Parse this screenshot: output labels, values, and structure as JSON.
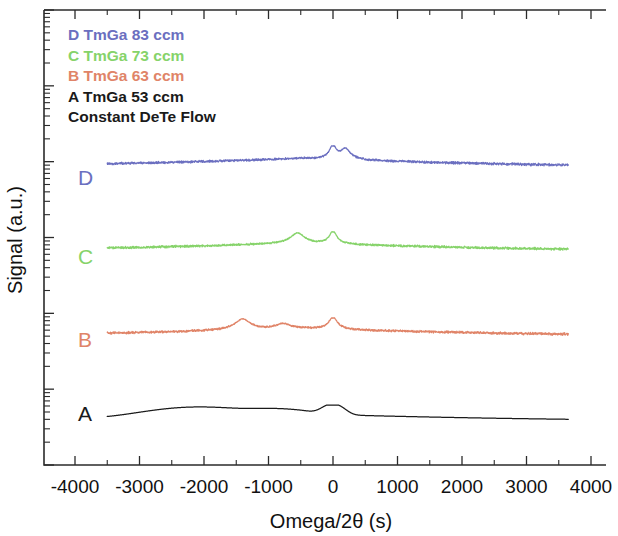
{
  "figure": {
    "axis_titles": {
      "x": "Omega/2θ (s)",
      "y": "Signal (a.u.)"
    }
  },
  "legend": {
    "entries": [
      {
        "label": "D TmGa 83 ccm",
        "color": "#6b6fc0"
      },
      {
        "label": "C TmGa 73 ccm",
        "color": "#86d36a"
      },
      {
        "label": "B TmGa 63 ccm",
        "color": "#e08468"
      },
      {
        "label": "A TmGa 53 ccm",
        "color": "#1a1a1a"
      },
      {
        "label": "Constant DeTe Flow",
        "color": "#1a1a1a"
      }
    ]
  },
  "curve_labels": [
    {
      "text": "D",
      "color": "#6b6fc0"
    },
    {
      "text": "C",
      "color": "#86d36a"
    },
    {
      "text": "B",
      "color": "#e08468"
    },
    {
      "text": "A",
      "color": "#1a1a1a"
    }
  ],
  "chart_data": {
    "type": "line",
    "title": "",
    "xlabel": "Omega/2θ (s)",
    "ylabel": "Signal (a.u.)",
    "xlim": [
      -4300,
      4300
    ],
    "xticks": [
      -4000,
      -3000,
      -2000,
      -1000,
      0,
      1000,
      2000,
      3000,
      4000
    ],
    "xtick_labels": [
      "-4000",
      "-3000",
      "-2000",
      "-1000",
      "0",
      "1000",
      "2000",
      "3000",
      "4000"
    ],
    "x_minor_tick_interval": 500,
    "y_axis": {
      "scale": "log",
      "labels_shown": false,
      "tick_style": "log-decade-minor-ticks",
      "decades": 6
    },
    "grid": false,
    "legend_position": "top-left",
    "x_data_range": [
      -3500,
      3650
    ],
    "series": [
      {
        "name": "A TmGa 53 ccm",
        "label": "A",
        "color": "#1a1a1a",
        "offset_index": 0,
        "noisy": false,
        "baseline": 0.1,
        "peaks": [
          {
            "center": 0,
            "height": 1.0,
            "width": 130,
            "kind": "main"
          },
          {
            "center": -850,
            "height": 0.3,
            "width": 380,
            "kind": "satellite"
          },
          {
            "center": -2100,
            "height": 0.62,
            "width": 620,
            "kind": "satellite"
          }
        ]
      },
      {
        "name": "B TmGa 63 ccm",
        "label": "B",
        "color": "#e08468",
        "offset_index": 1,
        "noisy": true,
        "baseline": 0.08,
        "peaks": [
          {
            "center": 0,
            "height": 1.0,
            "width": 55,
            "kind": "main"
          },
          {
            "center": -780,
            "height": 0.26,
            "width": 120,
            "kind": "satellite"
          },
          {
            "center": -1400,
            "height": 0.74,
            "width": 105,
            "kind": "satellite"
          }
        ]
      },
      {
        "name": "C TmGa 73 ccm",
        "label": "C",
        "color": "#86d36a",
        "offset_index": 2,
        "noisy": true,
        "baseline": 0.08,
        "peaks": [
          {
            "center": 0,
            "height": 1.0,
            "width": 48,
            "kind": "main"
          },
          {
            "center": -550,
            "height": 0.7,
            "width": 95,
            "kind": "satellite"
          }
        ]
      },
      {
        "name": "D TmGa 83 ccm",
        "label": "D",
        "color": "#6b6fc0",
        "offset_index": 3,
        "noisy": true,
        "baseline": 0.08,
        "peaks": [
          {
            "center": 0,
            "height": 1.0,
            "width": 45,
            "kind": "main"
          },
          {
            "center": 190,
            "height": 0.6,
            "width": 70,
            "kind": "shoulder"
          }
        ]
      }
    ]
  }
}
